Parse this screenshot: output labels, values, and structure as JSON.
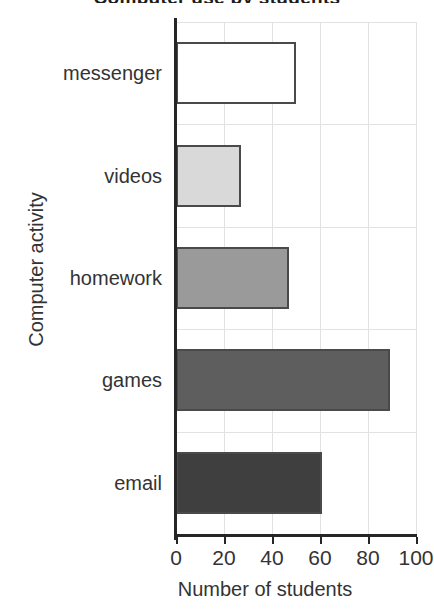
{
  "chart_data": {
    "type": "bar",
    "orientation": "horizontal",
    "title": "Computer use by students",
    "xlabel": "Number of students",
    "ylabel": "Computer activity",
    "categories": [
      "email",
      "games",
      "homework",
      "videos",
      "messenger"
    ],
    "values": [
      61,
      89,
      47,
      27,
      50
    ],
    "bar_colors": [
      "#3f3f3f",
      "#5e5e5e",
      "#9a9a9a",
      "#d9d9d9",
      "#ffffff"
    ],
    "bar_edge_color": "#4a4a4a",
    "xlim": [
      0,
      100
    ],
    "xticks": [
      0,
      20,
      40,
      60,
      80,
      100
    ],
    "xtick_labels": [
      "0",
      "20",
      "40",
      "60",
      "80",
      "100"
    ],
    "grid": true,
    "grid_color": "#e2e2e2",
    "legend": "none",
    "series": [
      {
        "name": "Number of students",
        "points": [
          {
            "category": "messenger",
            "value": 50,
            "fill": "#ffffff"
          },
          {
            "category": "videos",
            "value": 27,
            "fill": "#d9d9d9"
          },
          {
            "category": "homework",
            "value": 47,
            "fill": "#9a9a9a"
          },
          {
            "category": "games",
            "value": 89,
            "fill": "#5e5e5e"
          },
          {
            "category": "email",
            "value": 61,
            "fill": "#3f3f3f"
          }
        ]
      }
    ]
  }
}
